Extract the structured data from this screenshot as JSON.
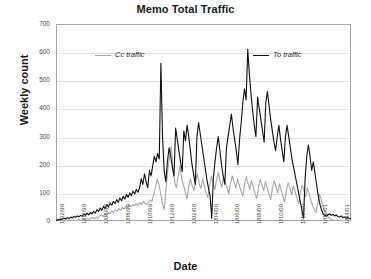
{
  "chart_data": {
    "type": "line",
    "title": "Memo Total Traffic",
    "xlabel": "Date",
    "ylabel": "Weekly count",
    "ylim": [
      0,
      700
    ],
    "ytick_values": [
      0,
      100,
      200,
      300,
      400,
      500,
      600,
      700
    ],
    "ytick_labels": [
      "0",
      "100",
      "200",
      "300",
      "400",
      "500",
      "600",
      "700"
    ],
    "grid": true,
    "legend_position": "top-inside",
    "xtick_labels": [
      "1/02/99",
      "1/04/99",
      "1/06/99",
      "1/08/99",
      "1/10/99",
      "1/12/99",
      "1/02/00",
      "1/04/00",
      "1/06/00",
      "1/08/00",
      "1/10/00",
      "1/12/00",
      "1/02/01",
      "1/04/01"
    ],
    "x_start": "1/02/99",
    "x_end": "1/05/01",
    "series": [
      {
        "name": "Cc traffic",
        "color": "#a8a8a8",
        "values": [
          0,
          0,
          0,
          0,
          0,
          2,
          0,
          3,
          2,
          0,
          4,
          2,
          0,
          5,
          3,
          2,
          6,
          4,
          8,
          5,
          10,
          12,
          8,
          14,
          10,
          18,
          22,
          16,
          26,
          20,
          30,
          26,
          36,
          30,
          40,
          34,
          44,
          38,
          48,
          42,
          52,
          46,
          56,
          50,
          58,
          54,
          62,
          56,
          66,
          58,
          70,
          62,
          60,
          66,
          74,
          70,
          96,
          120,
          150,
          128,
          96,
          62,
          40,
          110,
          180,
          222,
          265,
          190,
          140,
          118,
          160,
          196,
          150,
          128,
          104,
          78,
          120,
          150,
          126,
          108,
          142,
          168,
          132,
          116,
          150,
          126,
          100,
          84,
          128,
          160,
          134,
          112,
          146,
          172,
          140,
          120,
          156,
          138,
          118,
          96,
          134,
          160,
          138,
          118,
          150,
          128,
          106,
          88,
          130,
          156,
          134,
          112,
          144,
          120,
          98,
          80,
          120,
          148,
          128,
          108,
          140,
          118,
          96,
          76,
          116,
          144,
          122,
          100,
          132,
          110,
          88,
          68,
          108,
          136,
          116,
          94,
          126,
          104,
          82,
          62,
          100,
          128,
          108,
          86,
          118,
          96,
          74,
          54,
          40,
          30,
          66,
          96,
          74,
          52,
          34,
          22,
          14,
          8,
          5,
          3,
          2,
          1,
          0,
          2,
          1,
          0,
          1,
          0,
          0,
          0
        ]
      },
      {
        "name": "To traffic",
        "color": "#111111",
        "values": [
          2,
          4,
          6,
          5,
          8,
          10,
          7,
          12,
          9,
          14,
          11,
          16,
          13,
          18,
          15,
          20,
          17,
          24,
          20,
          28,
          22,
          30,
          26,
          34,
          28,
          40,
          34,
          46,
          38,
          52,
          44,
          58,
          50,
          64,
          56,
          70,
          62,
          76,
          66,
          82,
          72,
          88,
          78,
          94,
          84,
          100,
          90,
          106,
          96,
          112,
          102,
          118,
          150,
          130,
          168,
          140,
          118,
          180,
          160,
          196,
          230,
          210,
          240,
          220,
          560,
          300,
          180,
          140,
          210,
          260,
          230,
          190,
          160,
          330,
          290,
          250,
          210,
          175,
          320,
          285,
          340,
          300,
          250,
          200,
          165,
          130,
          300,
          350,
          310,
          270,
          230,
          190,
          150,
          118,
          90,
          10,
          150,
          210,
          260,
          300,
          250,
          200,
          160,
          130,
          260,
          300,
          340,
          380,
          330,
          290,
          250,
          200,
          290,
          350,
          420,
          470,
          430,
          610,
          520,
          450,
          390,
          340,
          300,
          440,
          400,
          360,
          320,
          280,
          420,
          460,
          410,
          360,
          320,
          280,
          250,
          300,
          340,
          290,
          250,
          210,
          300,
          340,
          300,
          260,
          220,
          190,
          160,
          130,
          100,
          70,
          40,
          10,
          150,
          230,
          270,
          230,
          180,
          210,
          170,
          130,
          90,
          60,
          40,
          25,
          20,
          18,
          22,
          26,
          20,
          24,
          18,
          22,
          16,
          14,
          18,
          12,
          14,
          10,
          12,
          8,
          10
        ]
      }
    ]
  },
  "axis": {
    "ytick_labels": [
      "700",
      "600",
      "500",
      "400",
      "300",
      "200",
      "100",
      "0"
    ]
  },
  "legend": {
    "cc_label": "Cc traffic",
    "to_label": "To traffic"
  }
}
